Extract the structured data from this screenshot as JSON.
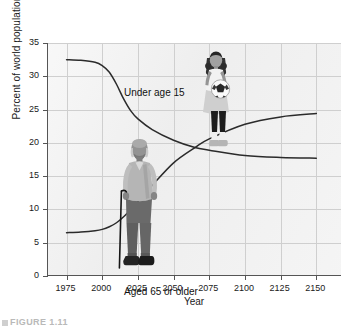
{
  "figure": {
    "caption_partial": "FIGURE 1.11",
    "caption_marker_icon": "square-bullet-icon"
  },
  "chart_data": {
    "type": "line",
    "title": "",
    "xlabel": "Year",
    "ylabel": "Percent of world population",
    "xlim": [
      1962,
      2168
    ],
    "ylim": [
      0,
      35
    ],
    "x_ticks": [
      1975,
      2000,
      2025,
      2050,
      2075,
      2100,
      2125,
      2150
    ],
    "y_ticks": [
      0,
      5,
      10,
      15,
      20,
      25,
      30,
      35
    ],
    "grid": true,
    "legend_position": "inline-annotations",
    "annotations": [
      {
        "text": "Under age 15",
        "x": 1977,
        "y": 34.2
      },
      {
        "text": "Aged 65 or older",
        "x": 1977,
        "y": 5.0
      }
    ],
    "x": [
      1975,
      1985,
      1995,
      2000,
      2005,
      2010,
      2015,
      2020,
      2025,
      2035,
      2050,
      2065,
      2075,
      2100,
      2125,
      2150
    ],
    "series": [
      {
        "name": "Under age 15",
        "values": [
          32.5,
          32.4,
          32.1,
          31.6,
          30.6,
          28.8,
          26.6,
          24.8,
          23.6,
          22.0,
          20.4,
          19.3,
          18.9,
          18.1,
          17.8,
          17.7
        ]
      },
      {
        "name": "Aged 65 or older",
        "values": [
          6.5,
          6.6,
          6.8,
          7.0,
          7.4,
          8.0,
          8.9,
          10.0,
          11.2,
          13.6,
          17.0,
          19.3,
          20.6,
          22.8,
          23.9,
          24.4
        ]
      }
    ],
    "crossover": {
      "year": 2072,
      "percent": 19.1
    }
  },
  "photos": [
    {
      "name": "girl-with-soccer-ball-photo",
      "alt": "Young girl holding a soccer ball"
    },
    {
      "name": "elderly-man-with-cane-photo",
      "alt": "Elderly man standing with a cane"
    }
  ]
}
